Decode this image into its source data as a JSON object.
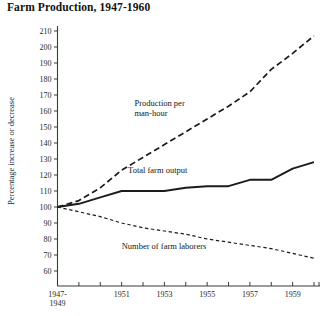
{
  "chart_data": {
    "type": "line",
    "title": "Farm Production, 1947-1960",
    "xlabel": "",
    "ylabel": "Percentage increase or decrease",
    "xlim": [
      1948,
      1960
    ],
    "ylim": [
      55,
      214
    ],
    "yticks": [
      60,
      70,
      80,
      90,
      100,
      110,
      120,
      130,
      140,
      150,
      160,
      170,
      180,
      190,
      200,
      210
    ],
    "ytick_labels": [
      "60",
      "70",
      "80",
      "90",
      "100",
      "110",
      "120",
      "130",
      "140",
      "150",
      "160",
      "170",
      "180",
      "190",
      "200",
      "210"
    ],
    "xticks": [
      1948,
      1949,
      1950,
      1951,
      1952,
      1953,
      1954,
      1955,
      1956,
      1957,
      1958,
      1959,
      1960
    ],
    "xtick_labels": [
      "1947-\n1949",
      "",
      "",
      "1951",
      "",
      "1953",
      "",
      "1955",
      "",
      "1957",
      "",
      "1959",
      ""
    ],
    "xtick_labels_flat": [
      "1947-1949",
      "1951",
      "1953",
      "1955",
      "1957",
      "1959"
    ],
    "baseline_label_line1": "1947-",
    "baseline_label_line2": "1949",
    "grid": false,
    "legend_position": "inline-annotations",
    "x": [
      1948,
      1949,
      1950,
      1951,
      1952,
      1953,
      1954,
      1955,
      1956,
      1957,
      1958,
      1959,
      1960
    ],
    "series": [
      {
        "name": "Production per man-hour",
        "style": "long-dashed",
        "color": "#1b1b1b",
        "values": [
          100,
          104,
          112,
          123,
          131,
          139,
          147,
          155,
          163,
          172,
          186,
          196,
          207
        ],
        "label_x": 1951.6,
        "label_y": 163
      },
      {
        "name": "Total farm output",
        "style": "solid",
        "color": "#1b1b1b",
        "values": [
          100,
          102,
          106,
          110,
          110,
          110,
          112,
          113,
          113,
          117,
          117,
          124,
          128
        ],
        "label_x": 1951.3,
        "label_y": 121
      },
      {
        "name": "Number of farm laborers",
        "style": "short-dashed",
        "color": "#1b1b1b",
        "values": [
          100,
          97,
          94,
          90,
          87,
          85,
          83,
          80,
          78,
          76,
          74,
          71,
          68
        ],
        "label_x": 1951.0,
        "label_y": 74
      }
    ]
  }
}
